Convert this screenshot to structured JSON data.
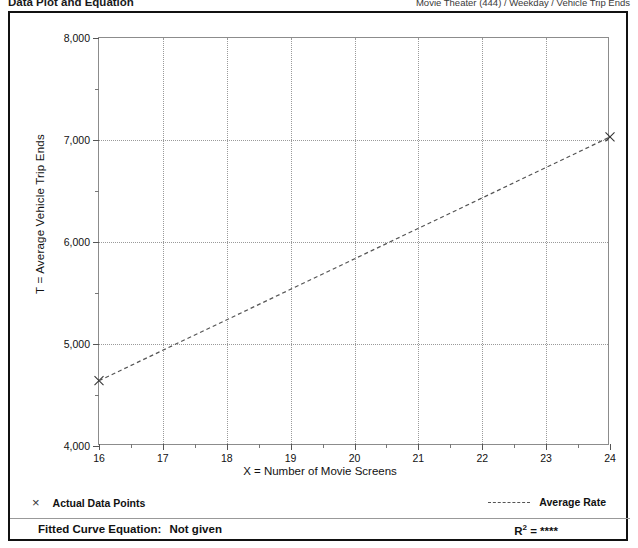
{
  "header": {
    "left_title": "Data Plot and Equation",
    "right_title": "Movie Theater (444) / Weekday / Vehicle Trip Ends"
  },
  "chart_data": {
    "type": "line",
    "title": "",
    "xlabel": "X = Number of Movie Screens",
    "ylabel": "T = Average Vehicle Trip Ends",
    "xlim": [
      16,
      24
    ],
    "ylim": [
      4000,
      8000
    ],
    "xticks": [
      16,
      17,
      18,
      19,
      20,
      21,
      22,
      23,
      24
    ],
    "xtick_labels": [
      "16",
      "17",
      "18",
      "19",
      "20",
      "21",
      "22",
      "23",
      "24"
    ],
    "yticks": [
      4000,
      5000,
      6000,
      7000,
      8000
    ],
    "ytick_labels": [
      "4,000",
      "5,000",
      "6,000",
      "7,000",
      "8,000"
    ],
    "y_minor_ticks": [
      4500,
      5500,
      6500,
      7500
    ],
    "grid": true,
    "grid_style": "dotted",
    "legend_position": "below-plot",
    "series": [
      {
        "name": "Actual Data Points",
        "type": "scatter",
        "marker": "x",
        "x": [
          16,
          24
        ],
        "y": [
          4640,
          7030
        ]
      },
      {
        "name": "Average Rate",
        "type": "line",
        "style": "dashed",
        "x": [
          16,
          24
        ],
        "y": [
          4640,
          7030
        ]
      }
    ]
  },
  "legend": {
    "actual_points_label": "Actual Data Points",
    "actual_points_marker": "×",
    "average_rate_label": "Average Rate"
  },
  "footer": {
    "fitted_curve_label": "Fitted Curve Equation:",
    "fitted_curve_value": "Not given",
    "r_label": "R",
    "r_exponent": "2",
    "r_equals": "= ****"
  },
  "colors": {
    "frame": "#111111",
    "axis": "#8c8c8c",
    "grid": "#9a9a9a",
    "series": "#555555",
    "text": "#111111"
  }
}
